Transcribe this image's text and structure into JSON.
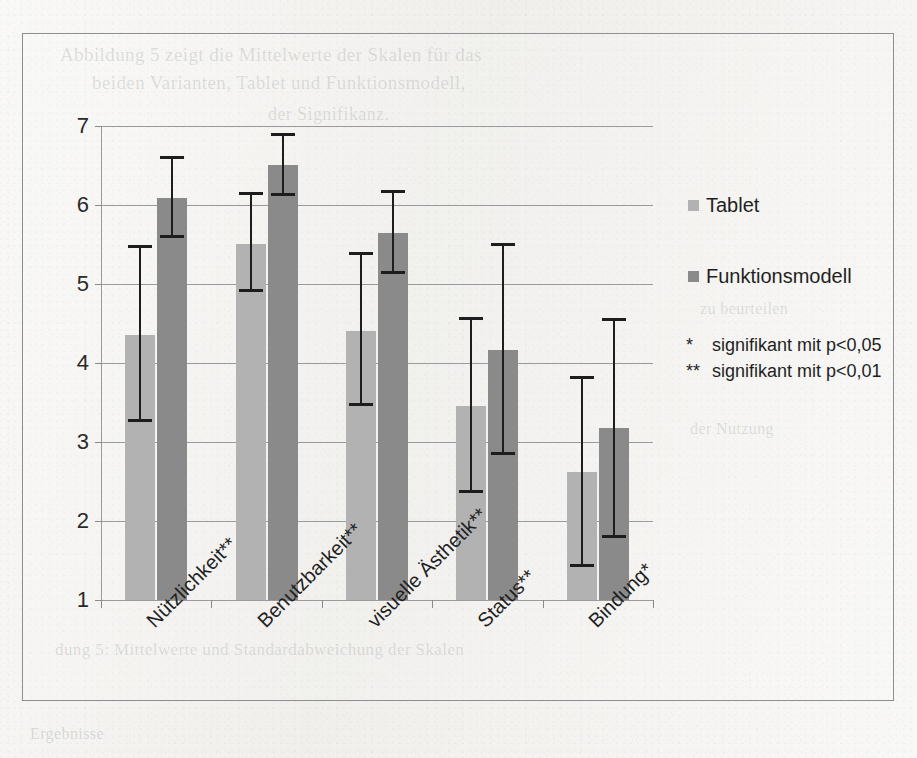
{
  "page": {
    "background_color": "#f2f1ee",
    "frame_border_color": "#8f8f92",
    "bleed_through": [
      "Abbildung 5 zeigt die Mittelwerte der Skalen für das",
      "beiden Varianten, Tablet und Funktionsmodell,",
      "der Signifikanz.",
      "dung 5: Mittelwerte und Standardabweichung der Skalen",
      "zu beurteilen",
      "der Nutzung",
      "Ergebnisse"
    ]
  },
  "chart_data": {
    "type": "bar",
    "title": "",
    "subtitle": "",
    "xlabel": "",
    "ylabel": "",
    "ylim": [
      1,
      7
    ],
    "yticks": [
      1,
      2,
      3,
      4,
      5,
      6,
      7
    ],
    "ytick_labels": [
      "1",
      "2",
      "3",
      "4",
      "5",
      "6",
      "7"
    ],
    "grid": true,
    "grid_axis": "y",
    "legend_position": "right",
    "categories": [
      "Nützlichkeit**",
      "Benutzbarkeit**",
      "visuelle Ästhetik**",
      "Status**",
      "Bindung*"
    ],
    "series": [
      {
        "name": "Tablet",
        "color": "#b2b2b2",
        "values": [
          4.35,
          5.51,
          4.41,
          3.45,
          2.62
        ],
        "error_low": [
          3.25,
          4.9,
          3.45,
          2.35,
          1.42
        ],
        "error_high": [
          5.49,
          6.16,
          5.41,
          4.58,
          3.83
        ]
      },
      {
        "name": "Funktionsmodell",
        "color": "#8a8a8a",
        "values": [
          6.09,
          6.51,
          5.64,
          4.16,
          3.18
        ],
        "error_low": [
          5.58,
          6.12,
          5.13,
          2.83,
          1.78
        ],
        "error_high": [
          6.62,
          6.91,
          6.19,
          5.52,
          4.57
        ]
      }
    ],
    "annotations": [
      {
        "mark": "*",
        "text": "signifikant mit p<0,05"
      },
      {
        "mark": "**",
        "text": "signifikant mit p<0,01"
      }
    ]
  }
}
